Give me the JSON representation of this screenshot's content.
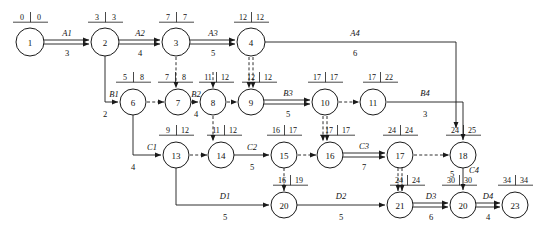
{
  "diagram": {
    "type": "network-diagram",
    "canvas": {
      "width": 544,
      "height": 234
    },
    "nodes": [
      {
        "id": "1",
        "label": "1",
        "x": 30,
        "y": 42,
        "r": 14,
        "early": "0",
        "late": "0",
        "tag_x": 30,
        "tag_y": 20
      },
      {
        "id": "2",
        "label": "2",
        "x": 105,
        "y": 42,
        "r": 14,
        "early": "3",
        "late": "3",
        "tag_x": 105,
        "tag_y": 20
      },
      {
        "id": "3",
        "label": "3",
        "x": 176,
        "y": 42,
        "r": 14,
        "early": "7",
        "late": "7",
        "tag_x": 176,
        "tag_y": 20
      },
      {
        "id": "4",
        "label": "4",
        "x": 251,
        "y": 42,
        "r": 14,
        "early": "12",
        "late": "12",
        "tag_x": 251,
        "tag_y": 20
      },
      {
        "id": "6",
        "label": "6",
        "x": 133,
        "y": 102,
        "r": 13,
        "early": "5",
        "late": "8",
        "tag_x": 133,
        "tag_y": 80
      },
      {
        "id": "7",
        "label": "7",
        "x": 178,
        "y": 102,
        "r": 13,
        "early": "7",
        "late": "8",
        "tag_x": 175,
        "tag_y": 80
      },
      {
        "id": "8",
        "label": "8",
        "x": 213,
        "y": 102,
        "r": 13,
        "early": "11",
        "late": "12",
        "tag_x": 216,
        "tag_y": 80
      },
      {
        "id": "9",
        "label": "9",
        "x": 251,
        "y": 102,
        "r": 13,
        "early": "12",
        "late": "12",
        "tag_x": 259,
        "tag_y": 80
      },
      {
        "id": "10",
        "label": "10",
        "x": 325,
        "y": 102,
        "r": 13,
        "early": "17",
        "late": "17",
        "tag_x": 325,
        "tag_y": 80
      },
      {
        "id": "11",
        "label": "11",
        "x": 373,
        "y": 102,
        "r": 13,
        "early": "17",
        "late": "22",
        "tag_x": 380,
        "tag_y": 80
      },
      {
        "id": "13",
        "label": "13",
        "x": 176,
        "y": 155,
        "r": 13,
        "early": "9",
        "late": "12",
        "tag_x": 176,
        "tag_y": 133
      },
      {
        "id": "14",
        "label": "14",
        "x": 221,
        "y": 155,
        "r": 13,
        "early": "11",
        "late": "12",
        "tag_x": 224,
        "tag_y": 133
      },
      {
        "id": "15",
        "label": "15",
        "x": 284,
        "y": 155,
        "r": 13,
        "early": "16",
        "late": "17",
        "tag_x": 284,
        "tag_y": 133
      },
      {
        "id": "16",
        "label": "16",
        "x": 330,
        "y": 155,
        "r": 13,
        "early": "17",
        "late": "17",
        "tag_x": 337,
        "tag_y": 133
      },
      {
        "id": "17",
        "label": "17",
        "x": 400,
        "y": 155,
        "r": 13,
        "early": "24",
        "late": "24",
        "tag_x": 400,
        "tag_y": 133
      },
      {
        "id": "18",
        "label": "18",
        "x": 463,
        "y": 155,
        "r": 13,
        "early": "24",
        "late": "25",
        "tag_x": 463,
        "tag_y": 133
      },
      {
        "id": "20a",
        "label": "20",
        "x": 284,
        "y": 205,
        "r": 13,
        "early": "16",
        "late": "19",
        "tag_x": 290,
        "tag_y": 183
      },
      {
        "id": "21",
        "label": "21",
        "x": 400,
        "y": 205,
        "r": 13,
        "early": "24",
        "late": "24",
        "tag_x": 407,
        "tag_y": 183
      },
      {
        "id": "20b",
        "label": "20",
        "x": 463,
        "y": 205,
        "r": 13,
        "early": "30",
        "late": "30",
        "tag_x": 459,
        "tag_y": 183
      },
      {
        "id": "23",
        "label": "23",
        "x": 515,
        "y": 205,
        "r": 13,
        "early": "34",
        "late": "34",
        "tag_x": 515,
        "tag_y": 183
      }
    ],
    "activities": [
      {
        "name": "A1",
        "from": "1",
        "to": "2",
        "duration": "3",
        "style": "double"
      },
      {
        "name": "A2",
        "from": "2",
        "to": "3",
        "duration": "4",
        "style": "double"
      },
      {
        "name": "A3",
        "from": "3",
        "to": "4",
        "duration": "5",
        "style": "double"
      },
      {
        "name": "A4",
        "from": "4",
        "to": "18",
        "duration": "6",
        "style": "solid"
      },
      {
        "name": "B1",
        "from": "2",
        "to": "6",
        "duration": "2",
        "style": "solid"
      },
      {
        "name": "B2",
        "from": "7",
        "to": "8",
        "duration": "4",
        "style": "solid"
      },
      {
        "name": "B3",
        "from": "9",
        "to": "10",
        "duration": "5",
        "style": "double"
      },
      {
        "name": "B4",
        "from": "11",
        "to": "18",
        "duration": "3",
        "style": "solid"
      },
      {
        "name": "C1",
        "from": "6",
        "to": "13",
        "duration": "4",
        "style": "solid"
      },
      {
        "name": "C2",
        "from": "14",
        "to": "15",
        "duration": "5",
        "style": "solid"
      },
      {
        "name": "C3",
        "from": "16",
        "to": "17",
        "duration": "7",
        "style": "double"
      },
      {
        "name": "C4",
        "from": "18",
        "to": "20b",
        "duration": "5",
        "style": "solid"
      },
      {
        "name": "D1",
        "from": "13",
        "to": "20a",
        "duration": "5",
        "style": "solid"
      },
      {
        "name": "D2",
        "from": "20a",
        "to": "21",
        "duration": "5",
        "style": "solid"
      },
      {
        "name": "D3",
        "from": "21",
        "to": "20b",
        "duration": "6",
        "style": "double"
      },
      {
        "name": "D4",
        "from": "20b",
        "to": "23",
        "duration": "4",
        "style": "double"
      }
    ],
    "dummy_links": [
      {
        "from": "3",
        "to": "8",
        "style": "dashed-vertical"
      },
      {
        "from": "4",
        "to": "9",
        "style": "dashed-double-vertical"
      },
      {
        "from": "6",
        "to": "7",
        "style": "dashed-horizontal"
      },
      {
        "from": "8",
        "to": "9",
        "style": "dashed-horizontal"
      },
      {
        "from": "8",
        "to": "14",
        "style": "dashed-vertical"
      },
      {
        "from": "10",
        "to": "11",
        "style": "dashed-horizontal"
      },
      {
        "from": "10",
        "to": "16",
        "style": "dashed-double-vertical"
      },
      {
        "from": "13",
        "to": "14",
        "style": "dashed-horizontal"
      },
      {
        "from": "15",
        "to": "16",
        "style": "dashed-horizontal"
      },
      {
        "from": "15",
        "to": "20a",
        "style": "dashed-vertical"
      },
      {
        "from": "17",
        "to": "18",
        "style": "dashed-horizontal"
      },
      {
        "from": "17",
        "to": "21",
        "style": "dashed-double-vertical"
      }
    ]
  }
}
